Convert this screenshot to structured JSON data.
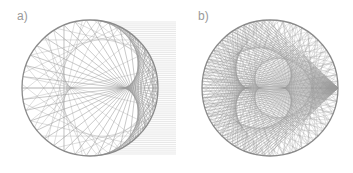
{
  "figure": {
    "panels": [
      {
        "id": "a",
        "label": "a)",
        "description": "Parallel rays entering from the right, reflected once inside a circular mirror, forming a nephroid caustic",
        "circle": {
          "cx": 90,
          "cy": 88,
          "r": 68
        },
        "incoming_rays": {
          "count": 70,
          "x_end": 176,
          "color": "#d8d8d8"
        },
        "reflected_rays": {
          "count": 56,
          "reflections": 2,
          "color": "#9a9a9a"
        },
        "circle_color": "#8a8a8a"
      },
      {
        "id": "b",
        "label": "b)",
        "description": "Rays emitted from a point source on the circle, reflected multiple times, forming a cardioid caustic",
        "circle": {
          "cx": 90,
          "cy": 88,
          "r": 68
        },
        "reflected_rays": {
          "count": 64,
          "reflections": 3,
          "color": "#9a9a9a"
        },
        "circle_color": "#8a8a8a"
      }
    ]
  }
}
